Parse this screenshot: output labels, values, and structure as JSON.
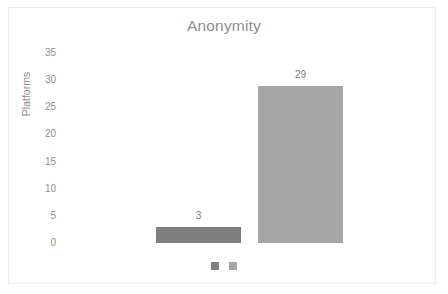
{
  "chart_data": {
    "type": "bar",
    "title": "Anonymity",
    "xlabel": "",
    "ylabel": "Platforms",
    "categories": [
      "",
      ""
    ],
    "values": [
      3,
      29
    ],
    "value_labels": [
      "3",
      "29"
    ],
    "series": [
      {
        "name": "",
        "values": [
          3,
          29
        ]
      }
    ],
    "colors": [
      "#7f7f7f",
      "#a6a6a6"
    ],
    "ylim": [
      0,
      35
    ],
    "ytick_labels": [
      "35",
      "30",
      "25",
      "20",
      "15",
      "10",
      "5",
      "0"
    ],
    "ytick_values": [
      35,
      30,
      25,
      20,
      15,
      10,
      5,
      0
    ],
    "grid": false,
    "legend_position": "bottom",
    "legend_entries": [
      {
        "label": "",
        "color": "#7f7f7f"
      },
      {
        "label": "",
        "color": "#a6a6a6"
      }
    ],
    "background_color": "#ffffff",
    "border_color": "#ededed",
    "title_color": "#8f8f8f",
    "tick_color": "#8f8f8f"
  }
}
